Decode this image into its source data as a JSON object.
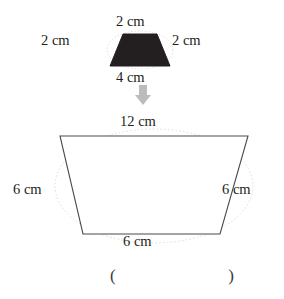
{
  "page": {
    "background_color": "#ffffff",
    "text_color": "#231f20"
  },
  "original_shape": {
    "name": "small-trapezoid",
    "fill_color": "#231f20",
    "labels": {
      "top": "2 cm",
      "left": "2 cm",
      "right": "2 cm",
      "bottom": "4 cm"
    }
  },
  "transform_arrow": {
    "name": "down-arrow",
    "direction": "down",
    "color": "#b5b5b5"
  },
  "enlarged_shape": {
    "name": "large-trapezoid",
    "fill_color": "#ffffff",
    "stroke_color": "#3f3f3f",
    "labels": {
      "top": "12 cm",
      "left": "6 cm",
      "right": "6 cm",
      "bottom": "6 cm"
    }
  },
  "answer": {
    "open_paren": "(",
    "close_paren": ")",
    "value": ""
  }
}
